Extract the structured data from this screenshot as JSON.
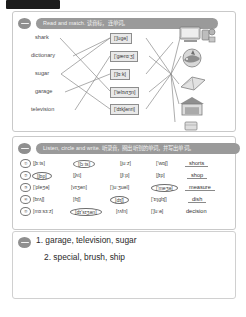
{
  "document": {
    "top_tab_label": ""
  },
  "exercise1": {
    "number_icon": "minus-circle-icon",
    "title": "Read and match. 读音标，连单词。",
    "words": [
      "shark",
      "dictionary",
      "sugar",
      "garage",
      "television"
    ],
    "phonetics": [
      "['ʃugə]",
      "['gærɑːʒ]",
      "['ʃɑːk]",
      "['telɪvɪʒn]",
      "['dɪkʃənri]"
    ],
    "pictures": [
      "television-icon",
      "shark-icon",
      "dictionary-icon",
      "garage-icon",
      "sugar-icon"
    ]
  },
  "exercise2": {
    "number_icon": "minus-circle-icon",
    "title": "Listen, circle and write. 听录音，圈出听到的单词，并写出单词。",
    "rows": [
      {
        "num": "①",
        "options": [
          "[ʃɜːts]",
          "[ʃɔːts]",
          "[juːz]",
          "['wɒʃ]"
        ],
        "circled": 1,
        "answer": "shorts"
      },
      {
        "num": "②",
        "options": [
          "[ʃɒp]",
          "[ʃʌt]",
          "[ʃiːp]",
          "[ʃɪp]"
        ],
        "circled": 0,
        "answer": "shop"
      },
      {
        "num": "③",
        "options": [
          "['pleʒə]",
          "[vɪʒən]",
          "['juːʒuəl]",
          "['meʒə]"
        ],
        "circled": 3,
        "answer": "measure"
      },
      {
        "num": "④",
        "options": [
          "[brʌʃ]",
          "[fɪʃ]",
          "[dɪʃ]",
          "['ɪŋglɪʃ]"
        ],
        "circled": 2,
        "answer": "dish"
      },
      {
        "num": "⑤",
        "options": [
          "[mɜːsɜːz]",
          "[dɪ'sɪʒən]",
          "[rʌfn]",
          "['ʃuːə]"
        ],
        "circled": 1,
        "answer": "decision"
      }
    ]
  },
  "answers": {
    "bullet_icon": "minus-circle-icon",
    "line1": "1. garage, television, sugar",
    "line2": "2. special, brush, ship"
  },
  "colors": {
    "banner": "#9a9a9a",
    "box_fill": "#e9e9e9",
    "border": "#c9c9c9"
  }
}
